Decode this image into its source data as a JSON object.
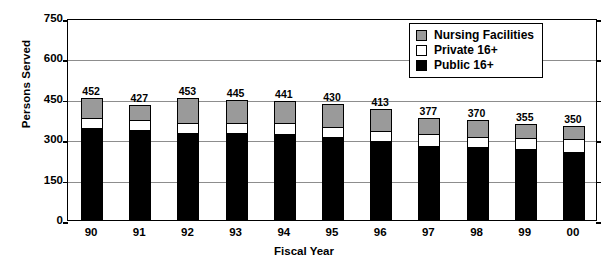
{
  "chart_data": {
    "type": "bar",
    "stacked": true,
    "title": "",
    "xlabel": "Fiscal Year",
    "ylabel": "Persons Served",
    "categories": [
      "90",
      "91",
      "92",
      "93",
      "94",
      "95",
      "96",
      "97",
      "98",
      "99",
      "00"
    ],
    "ylim": [
      0,
      750
    ],
    "yticks": [
      0,
      150,
      300,
      450,
      600,
      750
    ],
    "ytick_labels": [
      "0",
      "150",
      "300",
      "450",
      "600",
      "750"
    ],
    "grid": true,
    "legend_position": "top-right",
    "series": [
      {
        "name": "Public 16+",
        "color": "#000000",
        "values": [
          340,
          336,
          322,
          323,
          320,
          307,
          294,
          275,
          270,
          264,
          252
        ]
      },
      {
        "name": "Private 16+",
        "color": "#ffffff",
        "values": [
          37,
          36,
          37,
          38,
          42,
          38,
          38,
          45,
          40,
          41,
          48
        ]
      },
      {
        "name": "Nursing Facilities",
        "color": "#9a9a9a",
        "values": [
          75,
          55,
          94,
          84,
          79,
          85,
          81,
          57,
          60,
          50,
          50
        ]
      }
    ],
    "totals": [
      452,
      427,
      453,
      445,
      441,
      430,
      413,
      377,
      370,
      355,
      350
    ],
    "total_labels": [
      "452",
      "427",
      "453",
      "445",
      "441",
      "430",
      "413",
      "377",
      "370",
      "355",
      "350"
    ]
  },
  "legend": {
    "items": [
      {
        "label": "Nursing Facilities",
        "swatch": "gray"
      },
      {
        "label": "Private 16+",
        "swatch": "white"
      },
      {
        "label": "Public 16+",
        "swatch": "black"
      }
    ]
  }
}
